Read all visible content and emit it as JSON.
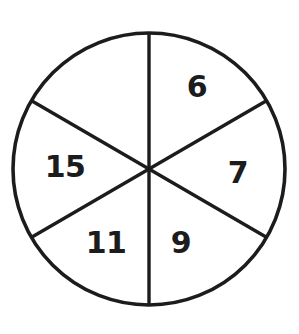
{
  "figure": {
    "name": "six-sector-spinner-wheel",
    "type": "spinner",
    "background_color": "#ffffff",
    "stroke_color": "#1c1c1c",
    "fill_color": "#ffffff",
    "stroke_width": 3.6
  },
  "wheel": {
    "center_x": 149,
    "center_y": 169,
    "radius": 136,
    "sector_count": 6,
    "sector_angle_degrees": 60
  },
  "chart_data": {
    "type": "pie",
    "title": "",
    "xlabel": "",
    "ylabel": "",
    "legend": "none",
    "grid": false,
    "equal_sectors": true,
    "categories": [
      "6",
      "7",
      "9",
      "11",
      "15",
      ""
    ],
    "values": [
      1,
      1,
      1,
      1,
      1,
      1
    ],
    "sectors": [
      {
        "index": 0,
        "label": "6",
        "position": "upper-right",
        "start_angle_degrees": 0,
        "end_angle_degrees": 60,
        "label_x": 197,
        "label_y": 86,
        "share_percent": 16.7
      },
      {
        "index": 1,
        "label": "7",
        "position": "right",
        "start_angle_degrees": 60,
        "end_angle_degrees": 120,
        "label_x": 238,
        "label_y": 172,
        "share_percent": 16.7
      },
      {
        "index": 2,
        "label": "9",
        "position": "lower-right",
        "start_angle_degrees": 120,
        "end_angle_degrees": 180,
        "label_x": 181,
        "label_y": 242,
        "share_percent": 16.7
      },
      {
        "index": 3,
        "label": "11",
        "position": "lower-left",
        "start_angle_degrees": 180,
        "end_angle_degrees": 240,
        "label_x": 106,
        "label_y": 242,
        "share_percent": 16.7
      },
      {
        "index": 4,
        "label": "15",
        "position": "left",
        "start_angle_degrees": 240,
        "end_angle_degrees": 300,
        "label_x": 65,
        "label_y": 166,
        "share_percent": 16.7
      },
      {
        "index": 5,
        "label": "",
        "position": "upper-left",
        "start_angle_degrees": 300,
        "end_angle_degrees": 360,
        "label_x": 102,
        "label_y": 86,
        "share_percent": 16.7
      }
    ]
  },
  "dividers": [
    {
      "name": "vertical-diameter",
      "x1": 149,
      "y1": 33,
      "x2": 149,
      "y2": 305
    },
    {
      "name": "diagonal-diameter-ne-sw",
      "x1": 266,
      "y1": 101,
      "x2": 32,
      "y2": 237
    },
    {
      "name": "diagonal-diameter-nw-se",
      "x1": 32,
      "y1": 101,
      "x2": 266,
      "y2": 237
    }
  ]
}
